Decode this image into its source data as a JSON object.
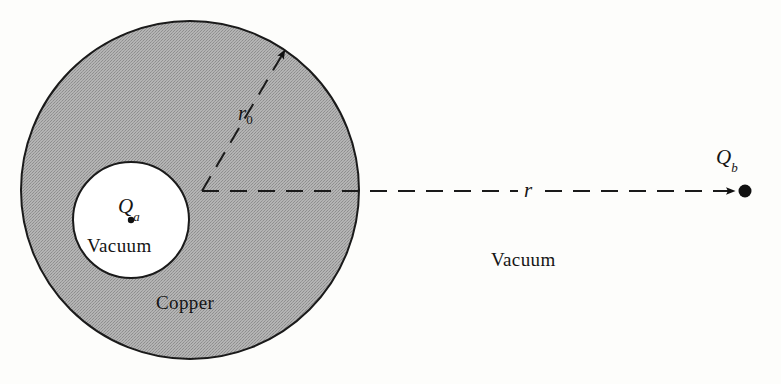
{
  "figure": {
    "width": 781,
    "height": 384,
    "background_color": "#fdfdfb"
  },
  "regions": {
    "shell": {
      "material_label": "Copper",
      "fill_color": "#a8a8a8",
      "stroke_color": "#1a1a1a",
      "center_x": 190,
      "center_y": 190,
      "radius": 169
    },
    "cavity": {
      "material_label": "Vacuum",
      "fill_color": "#ffffff",
      "stroke_color": "#1a1a1a",
      "center_x": 131,
      "center_y": 220,
      "radius": 58
    },
    "exterior": {
      "material_label": "Vacuum",
      "fill_color": "#fdfdfb"
    }
  },
  "charges": [
    {
      "name": "inner-charge",
      "label": "Q",
      "subscript": "a",
      "x": 131,
      "y": 220,
      "dot_radius": 3.2,
      "color": "#111111"
    },
    {
      "name": "outer-charge",
      "label": "Q",
      "subscript": "b",
      "x": 745,
      "y": 191,
      "dot_radius": 6.5,
      "color": "#111111"
    }
  ],
  "measurements": [
    {
      "name": "shell-radius",
      "label": "r",
      "subscript": "0",
      "from_x": 202,
      "from_y": 191,
      "to_x": 288,
      "to_y": 45,
      "style": "dashed-arrow"
    },
    {
      "name": "charge-separation",
      "label": "r",
      "subscript": "",
      "from_x": 202,
      "from_y": 191,
      "to_x": 741,
      "to_y": 191,
      "style": "dashed-arrow"
    }
  ],
  "strokes": {
    "dash_pattern": "17 11",
    "line_width": 2,
    "line_color": "#1a1a1a",
    "circle_line_width": 2
  }
}
